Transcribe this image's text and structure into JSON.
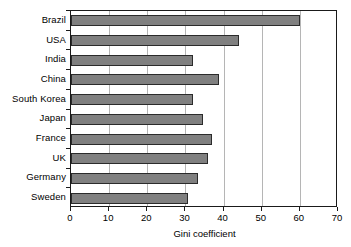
{
  "chart_data": {
    "type": "bar",
    "orientation": "horizontal",
    "title": "",
    "xlabel": "Gini coefficient",
    "ylabel": "",
    "xlim": [
      0,
      70
    ],
    "xticks": [
      0,
      10,
      20,
      30,
      40,
      50,
      60,
      70
    ],
    "xtick_labels": [
      "0",
      "10",
      "20",
      "30",
      "40",
      "50",
      "60",
      "70"
    ],
    "grid": true,
    "grid_axis": "x",
    "legend": false,
    "categories": [
      "Brazil",
      "USA",
      "India",
      "China",
      "South Korea",
      "Japan",
      "France",
      "UK",
      "Germany",
      "Sweden"
    ],
    "values": [
      60,
      44,
      32,
      38.7,
      32,
      34.7,
      37,
      36,
      33.4,
      30.7
    ],
    "bar_color": "#808080",
    "bar_edge_color": "#2b2b2b",
    "grid_color": "#b5b5b5",
    "axis_color": "#1a1a1a",
    "background_color": "#ffffff"
  }
}
